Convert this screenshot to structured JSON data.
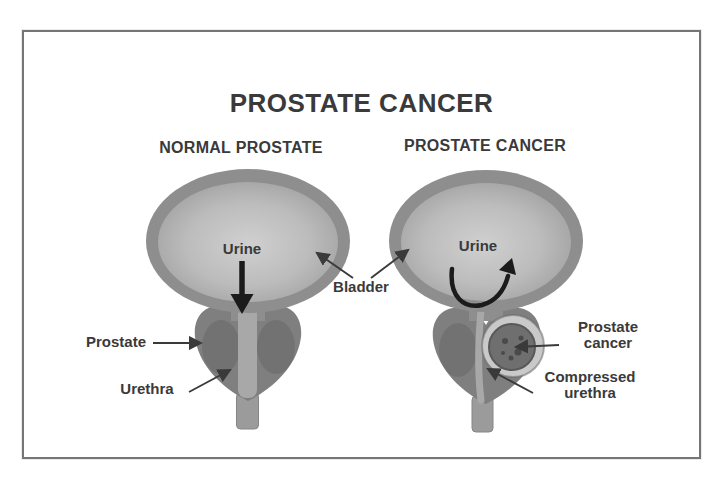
{
  "figure": {
    "title": "PROSTATE CANCER",
    "panels": [
      {
        "subtitle": "NORMAL PROSTATE"
      },
      {
        "subtitle": "PROSTATE CANCER"
      }
    ],
    "labels": {
      "urine_left": "Urine",
      "urine_right": "Urine",
      "bladder": "Bladder",
      "prostate": "Prostate",
      "urethra": "Urethra",
      "prostate_cancer": "Prostate cancer",
      "compressed_urethra": "Compressed urethra"
    },
    "icons": {
      "urine_flow_normal": "straight-down-arrow",
      "urine_flow_obstructed": "curved-blocked-arrow",
      "label_pointers": "thin-arrow"
    },
    "colors": {
      "background": "#ffffff",
      "ink": "#3a3a3a",
      "frame_border": "#767676",
      "bladder_wall": "#8e8e8e",
      "bladder_lumen_light": "#d0d0d0",
      "bladder_lumen_mid": "#bcbcbc",
      "bladder_lumen_dark": "#9d9d9d",
      "prostate_tissue": "#7f7f7f",
      "urethra_channel": "#a8a8a8",
      "urethra_stem": "#9b9b9b",
      "tumor_halo": "#c9c9c9",
      "tumor_core": "#6f6f6f",
      "arrow_black": "#1b1b1b"
    }
  }
}
